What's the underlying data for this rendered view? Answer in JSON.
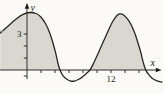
{
  "figure": {
    "background": "#fbfaf6",
    "fill_color": "#d8d7d0",
    "curve_color": "#262626",
    "axis_color": "#1c1c1c",
    "artifact_color": "#9a9a93",
    "xlabel": "x",
    "ylabel": "y"
  },
  "chart_data": {
    "type": "area",
    "title": "",
    "xlabel": "x",
    "ylabel": "y",
    "xlim": [
      -3.85,
      19.5
    ],
    "ylim": [
      -2.0,
      5.8
    ],
    "grid": false,
    "legend": false,
    "x_ticks": [
      2,
      4,
      6,
      8,
      10,
      12,
      14,
      16
    ],
    "y_ticks": [
      -0.5,
      1,
      2,
      3
    ],
    "x_axis_labeled_tick": {
      "value": 12,
      "label": "12"
    },
    "y_axis_labeled_tick": {
      "value": 3,
      "label": "3"
    },
    "shaded_region": "area between curve and x-axis where y >= 0",
    "series": [
      {
        "name": "periodic curve",
        "points": [
          [
            -3.81,
            3.08
          ],
          [
            -2.68,
            3.67
          ],
          [
            -1.55,
            4.25
          ],
          [
            -0.56,
            4.63
          ],
          [
            0.42,
            4.79
          ],
          [
            1.27,
            4.71
          ],
          [
            1.98,
            4.42
          ],
          [
            2.68,
            3.83
          ],
          [
            3.25,
            3.08
          ],
          [
            3.67,
            2.33
          ],
          [
            4.09,
            1.42
          ],
          [
            4.38,
            0.67
          ],
          [
            4.66,
            0.08
          ],
          [
            5.08,
            -0.42
          ],
          [
            5.65,
            -0.75
          ],
          [
            6.21,
            -0.92
          ],
          [
            6.78,
            -0.92
          ],
          [
            7.34,
            -0.79
          ],
          [
            7.91,
            -0.58
          ],
          [
            8.47,
            -0.29
          ],
          [
            9.04,
            0.04
          ],
          [
            9.6,
            0.67
          ],
          [
            10.31,
            1.58
          ],
          [
            11.01,
            2.5
          ],
          [
            11.72,
            3.42
          ],
          [
            12.28,
            4.08
          ],
          [
            12.85,
            4.54
          ],
          [
            13.27,
            4.67
          ],
          [
            13.69,
            4.63
          ],
          [
            14.26,
            4.33
          ],
          [
            14.82,
            3.83
          ],
          [
            15.39,
            3.08
          ],
          [
            15.81,
            2.33
          ],
          [
            16.24,
            1.5
          ],
          [
            16.52,
            0.83
          ],
          [
            16.8,
            0.25
          ],
          [
            17.08,
            -0.13
          ],
          [
            17.51,
            -0.46
          ],
          [
            17.93,
            -0.71
          ],
          [
            18.49,
            -0.88
          ],
          [
            18.92,
            -0.96
          ],
          [
            19.27,
            -1.0
          ]
        ]
      }
    ]
  }
}
